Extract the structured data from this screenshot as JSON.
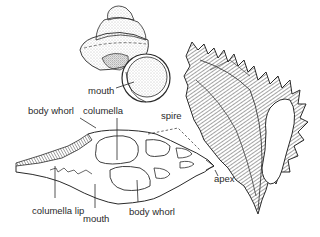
{
  "diagram": {
    "colors": {
      "ink": "#2a2a2a",
      "background": "#ffffff",
      "stipple": "#9a9a9a"
    },
    "figures": [
      {
        "id": "top-snail",
        "description": "globular snail shell with round mouth",
        "labels": [
          "mouth"
        ]
      },
      {
        "id": "murex",
        "description": "spiny murex shell with fringed outer lip",
        "labels": []
      },
      {
        "id": "cross-section",
        "description": "longitudinal section of a spindle shell",
        "labels": [
          "body whorl",
          "columella",
          "spire",
          "apex",
          "columella lip",
          "mouth",
          "body whorl"
        ]
      }
    ],
    "labels": {
      "top_mouth": "mouth",
      "body_whorl_top": "body whorl",
      "columella": "columella",
      "spire": "spire",
      "apex": "apex",
      "columella_lip": "columella lip",
      "mouth_bottom": "mouth",
      "body_whorl_bottom": "body whorl"
    }
  }
}
